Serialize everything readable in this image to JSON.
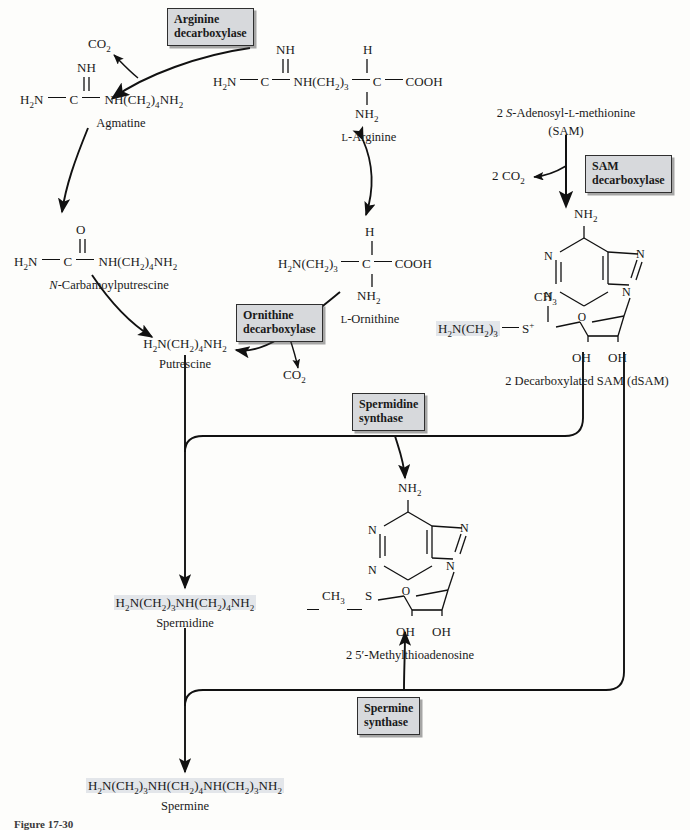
{
  "figure": {
    "caption": "Figure 17-30"
  },
  "enzymes": [
    {
      "id": "arginine-decarboxylase",
      "line1": "Arginine",
      "line2": "decarboxylase"
    },
    {
      "id": "sam-decarboxylase",
      "line1": "SAM",
      "line2": "decarboxylase"
    },
    {
      "id": "ornithine-decarboxylase",
      "line1": "Ornithine",
      "line2": "decarboxylase"
    },
    {
      "id": "spermidine-synthase",
      "line1": "Spermidine",
      "line2": "synthase"
    },
    {
      "id": "spermine-synthase",
      "line1": "Spermine",
      "line2": "synthase"
    }
  ],
  "metabolites": {
    "co2_agmatine": "CO2",
    "co2_ornithine": "CO2",
    "co2_sam": "2 CO2",
    "agmatine_name": "Agmatine",
    "arginine_name": "L-Arginine",
    "sam_line1": "2 S-Adenosyl-L-methionine",
    "sam_line2": "(SAM)",
    "carbamoylputrescine_name_italic": "N",
    "carbamoylputrescine_name_rest": "-Carbamoylputrescine",
    "ornithine_name": "L-Ornithine",
    "putrescine_formula": "H2N(CH2)4NH2",
    "putrescine_name": "Putrescine",
    "dsam_name": "2 Decarboxylated SAM (dSAM)",
    "dsam_side_chain": "H2N(CH2)3",
    "dsam_methyl": "CH3",
    "mta_name": "2  5′-Methylthioadenosine",
    "mta_methyl": "CH3",
    "mta_sulfur": "S",
    "spermidine_formula": "H2N(CH2)3NH(CH2)4NH2",
    "spermidine_name": "Spermidine",
    "spermine_formula": "H2N(CH2)3NH(CH2)4NH(CH2)3NH2",
    "spermine_name": "Spermine",
    "amino_label": "NH2",
    "hydroxyl_label": "OH",
    "ring_n": "N",
    "ring_o": "O"
  },
  "structures": {
    "agmatine": {
      "top": "NH",
      "left": "H2N",
      "center": "C",
      "right": "NH(CH2)4NH2"
    },
    "arginine": {
      "top_imine": "NH",
      "left": "H2N",
      "c1": "C",
      "mid": "NH(CH2)3",
      "c2": "C",
      "acid": "COOH",
      "h": "H",
      "amine": "NH2"
    },
    "carbamoylputrescine": {
      "top": "O",
      "left": "H2N",
      "center": "C",
      "right": "NH(CH2)4NH2"
    },
    "ornithine": {
      "left": "H2N(CH2)3",
      "center": "C",
      "acid": "COOH",
      "h": "H",
      "amine": "NH2"
    }
  },
  "colors": {
    "enzyme_box_fill": "#d7d9dc",
    "enzyme_box_border": "#2f2f2f",
    "highlight": "#e3e6ea",
    "line": "#111111",
    "page_background": "#fdfdfb"
  }
}
